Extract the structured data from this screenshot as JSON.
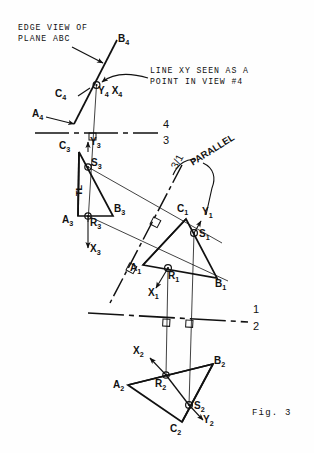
{
  "figure": {
    "caption": "Fig. 3",
    "annotations": {
      "edge_view": "EDGE VIEW OF\nPLANE ABC",
      "line_xy_point": "LINE XY SEEN AS A\nPOINT IN VIEW #4",
      "parallel": "PARALLEL",
      "true_length": "TL"
    },
    "fold_lines": [
      {
        "name": "fold-4-3",
        "upper": "4",
        "lower": "3"
      },
      {
        "name": "fold-3-1",
        "upper": "3",
        "lower": "1"
      },
      {
        "name": "fold-1-2",
        "upper": "1",
        "lower": "2"
      }
    ],
    "views": [
      {
        "name": "view-4",
        "points": [
          {
            "id": "B4",
            "label": "B",
            "sub": "4"
          },
          {
            "id": "C4",
            "label": "C",
            "sub": "4"
          },
          {
            "id": "A4",
            "label": "A",
            "sub": "4"
          },
          {
            "id": "Y4X4",
            "label": "Y",
            "sub": "4"
          },
          {
            "id": "X4",
            "label": "X",
            "sub": "4"
          }
        ]
      },
      {
        "name": "view-3",
        "points": [
          {
            "id": "C3",
            "label": "C",
            "sub": "3"
          },
          {
            "id": "S3",
            "label": "S",
            "sub": "3"
          },
          {
            "id": "B3",
            "label": "B",
            "sub": "3"
          },
          {
            "id": "A3",
            "label": "A",
            "sub": "3"
          },
          {
            "id": "R3",
            "label": "R",
            "sub": "3"
          },
          {
            "id": "Y3",
            "label": "Y",
            "sub": "3"
          },
          {
            "id": "X3",
            "label": "X",
            "sub": "3"
          }
        ]
      },
      {
        "name": "view-1",
        "points": [
          {
            "id": "C1",
            "label": "C",
            "sub": "1"
          },
          {
            "id": "Y1",
            "label": "Y",
            "sub": "1"
          },
          {
            "id": "S1",
            "label": "S",
            "sub": "1"
          },
          {
            "id": "A1",
            "label": "A",
            "sub": "1"
          },
          {
            "id": "R1",
            "label": "R",
            "sub": "1"
          },
          {
            "id": "B1",
            "label": "B",
            "sub": "1"
          },
          {
            "id": "X1",
            "label": "X",
            "sub": "1"
          }
        ]
      },
      {
        "name": "view-2",
        "points": [
          {
            "id": "X2",
            "label": "X",
            "sub": "2"
          },
          {
            "id": "B2",
            "label": "B",
            "sub": "2"
          },
          {
            "id": "A2",
            "label": "A",
            "sub": "2"
          },
          {
            "id": "R2",
            "label": "R",
            "sub": "2"
          },
          {
            "id": "S2",
            "label": "S",
            "sub": "2"
          },
          {
            "id": "Y2",
            "label": "Y",
            "sub": "2"
          },
          {
            "id": "C2",
            "label": "C",
            "sub": "2"
          }
        ]
      }
    ],
    "colors": {
      "ink": "#111111",
      "paper": "#ffffff"
    }
  }
}
